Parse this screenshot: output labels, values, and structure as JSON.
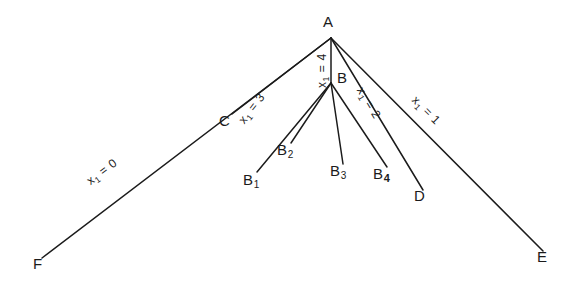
{
  "diagram": {
    "background_color": "#ffffff",
    "line_color": "#1b1b1b",
    "nodes": [
      {
        "id": "A",
        "label": "A",
        "sub": "",
        "x": 331,
        "y": 38,
        "label_x": 323,
        "label_y": 14
      },
      {
        "id": "B",
        "label": "B",
        "sub": "",
        "x": 331,
        "y": 83,
        "label_x": 337,
        "label_y": 70
      },
      {
        "id": "C",
        "label": "C",
        "sub": "",
        "x": 232,
        "y": 114,
        "label_x": 219,
        "label_y": 113
      },
      {
        "id": "D",
        "label": "D",
        "sub": "",
        "x": 423,
        "y": 190,
        "label_x": 414,
        "label_y": 188
      },
      {
        "id": "E",
        "label": "E",
        "sub": "",
        "x": 543,
        "y": 251,
        "label_x": 537,
        "label_y": 249
      },
      {
        "id": "F",
        "label": "F",
        "sub": "",
        "x": 42,
        "y": 258,
        "label_x": 33,
        "label_y": 256
      },
      {
        "id": "B1",
        "label": "B",
        "sub": "1",
        "x": 257,
        "y": 172,
        "label_x": 243,
        "label_y": 172
      },
      {
        "id": "B2",
        "label": "B",
        "sub": "2",
        "x": 291,
        "y": 143,
        "label_x": 277,
        "label_y": 142
      },
      {
        "id": "B3",
        "label": "B",
        "sub": "3",
        "x": 343,
        "y": 164,
        "label_x": 330,
        "label_y": 163
      },
      {
        "id": "B4",
        "label": "B",
        "sub": "4",
        "x": 387,
        "y": 167,
        "label_x": 373,
        "label_y": 166
      }
    ],
    "edges": [
      {
        "id": "A-F",
        "from": "A",
        "to": "F",
        "x1": 331,
        "y1": 38,
        "x2": 42,
        "y2": 258
      },
      {
        "id": "A-C",
        "from": "A",
        "to": "C",
        "x1": 331,
        "y1": 38,
        "x2": 232,
        "y2": 114
      },
      {
        "id": "A-B",
        "from": "A",
        "to": "B",
        "x1": 331,
        "y1": 38,
        "x2": 331,
        "y2": 83
      },
      {
        "id": "A-D",
        "from": "A",
        "to": "D",
        "x1": 331,
        "y1": 38,
        "x2": 423,
        "y2": 190
      },
      {
        "id": "A-E",
        "from": "A",
        "to": "E",
        "x1": 331,
        "y1": 38,
        "x2": 543,
        "y2": 251
      },
      {
        "id": "B-B1",
        "from": "B",
        "to": "B1",
        "x1": 331,
        "y1": 83,
        "x2": 257,
        "y2": 172
      },
      {
        "id": "B-B2",
        "from": "B",
        "to": "B2",
        "x1": 331,
        "y1": 83,
        "x2": 291,
        "y2": 143
      },
      {
        "id": "B-B3",
        "from": "B",
        "to": "B3",
        "x1": 331,
        "y1": 83,
        "x2": 343,
        "y2": 164
      },
      {
        "id": "B-B4",
        "from": "B",
        "to": "B4",
        "x1": 331,
        "y1": 83,
        "x2": 387,
        "y2": 167
      }
    ],
    "edge_labels": [
      {
        "id": "label-x1-0",
        "edge": "A-F",
        "var": "x",
        "sub": "1",
        "eq": " = 0",
        "text": "x1 = 0",
        "x": 88,
        "y": 176,
        "rotate": -37
      },
      {
        "id": "label-x1-3",
        "edge": "A-C",
        "var": "x",
        "sub": "1",
        "eq": " = 3",
        "text": "x1 = 3",
        "x": 241,
        "y": 116,
        "rotate": -52
      },
      {
        "id": "label-x1-4",
        "edge": "A-B",
        "var": "x",
        "sub": "1",
        "eq": " = 4",
        "text": "x1 = 4",
        "x": 322,
        "y": 82,
        "rotate": -90
      },
      {
        "id": "label-x1-2",
        "edge": "A-D",
        "var": "x",
        "sub": "1",
        "eq": " = 2",
        "text": "x1 = 2",
        "x": 360,
        "y": 82,
        "rotate": 59
      },
      {
        "id": "label-x1-1",
        "edge": "A-E",
        "var": "x",
        "sub": "1",
        "eq": " = 1",
        "text": "x1 = 1",
        "x": 414,
        "y": 92,
        "rotate": 45
      }
    ]
  }
}
